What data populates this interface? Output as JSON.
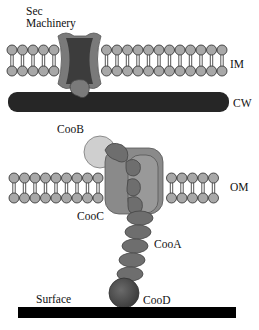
{
  "diagram": {
    "labels": {
      "sec_line1": "Sec",
      "sec_line2": "Machinery",
      "im": "IM",
      "cw": "CW",
      "om": "OM",
      "coob": "CooB",
      "cooc": "CooC",
      "cooa": "CooA",
      "surface": "Surface",
      "cood": "CooD"
    },
    "colors": {
      "lipid_head": "#a8a8a8",
      "lipid_stroke": "#2a2a2a",
      "sec_outer": "#7a7a7a",
      "sec_inner": "#3c3c3c",
      "cell_wall": "#262626",
      "coob": "#cfcfcf",
      "cooc": "#8a8a8a",
      "cooa": "#6e6e6e",
      "cood": "#555555",
      "surface": "#000000"
    }
  }
}
